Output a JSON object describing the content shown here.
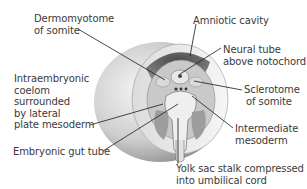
{
  "figure": {
    "labels": {
      "dermomyotome": [
        "Dermomyotome",
        "of somite"
      ],
      "amniotic_cavity": [
        "Amniotic cavity"
      ],
      "neural_tube": [
        "Neural tube",
        "above notochord"
      ],
      "intraembryonic_coelom": [
        "Intraembryonic",
        "coelom",
        "surrounded",
        "by lateral",
        "plate mesoderm"
      ],
      "sclerotome": [
        "Sclerotome",
        "of somite"
      ],
      "intermediate_mesoderm": [
        "Intermediate",
        "mesoderm"
      ],
      "gut_tube": [
        "Embryonic gut tube"
      ],
      "yolk_sac_stalk": [
        "Yolk sac stalk compressed",
        "into umbilical cord"
      ]
    }
  }
}
